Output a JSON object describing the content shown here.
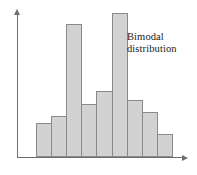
{
  "chart_data": {
    "type": "bar",
    "title": "",
    "subtitle": "",
    "xlabel": "",
    "ylabel": "",
    "categories": [
      "1",
      "2",
      "3",
      "4",
      "5",
      "6",
      "7",
      "8",
      "9"
    ],
    "values": [
      31,
      38,
      123,
      49,
      61,
      133,
      53,
      42,
      21
    ],
    "ylim": [
      0,
      145
    ],
    "grid": false,
    "legend": null,
    "annotations": [
      {
        "name": "bimodal-distribution-label",
        "lines": [
          "Bimodal",
          "distribution"
        ],
        "text": "Bimodal distribution"
      }
    ],
    "axes": {
      "x_axis_arrow": true,
      "y_axis_arrow": true,
      "x_tick_labels": [],
      "y_tick_labels": []
    },
    "style": {
      "bar_fill": "#d2d2d2",
      "bar_stroke": "#8a8a8a",
      "axis_color": "#6e6e6e",
      "text_color": "#1a1a1a",
      "background": "#ffffff"
    }
  }
}
